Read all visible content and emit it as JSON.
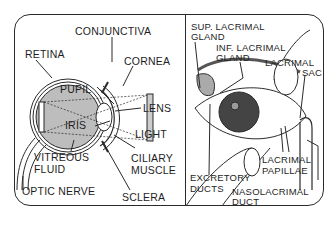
{
  "left_panel": {
    "title": "Cross-section of the eye",
    "labels": {
      "conjunctiva": "CONJUNCTIVA",
      "retina": "RETINA",
      "cornea": "CORNEA",
      "pupil": "PUPIL",
      "lens": "LENS",
      "iris": "IRIS",
      "light": "LIGHT",
      "vitreous_1": "VITREOUS",
      "vitreous_2": "FLUID",
      "ciliary_1": "CILIARY",
      "ciliary_2": "MUSCLE",
      "optic_nerve": "OPTIC NERVE",
      "sclera": "SCLERA"
    }
  },
  "right_panel": {
    "title": "Lacrimal apparatus",
    "labels": {
      "sup_lacrimal_1": "SUP. LACRIMAL",
      "sup_lacrimal_2": "GLAND",
      "inf_lacrimal_1": "INF. LACRIMAL",
      "inf_lacrimal_2": "GLAND",
      "lacrimal_sac_1": "LACRIMAL",
      "lacrimal_sac_2": "SAC",
      "lacrimal_papillae_1": "LACRIMAL",
      "lacrimal_papillae_2": "PAPILLAE",
      "excretory_1": "EXCRETORY",
      "excretory_2": "DUCTS",
      "nasolacrimal_1": "NASOLACRIMAL",
      "nasolacrimal_2": "DUCT"
    }
  },
  "colors": {
    "line": "#2a2a2a",
    "eyeball_fill": "#bdbdbd",
    "background": "#ffffff"
  }
}
